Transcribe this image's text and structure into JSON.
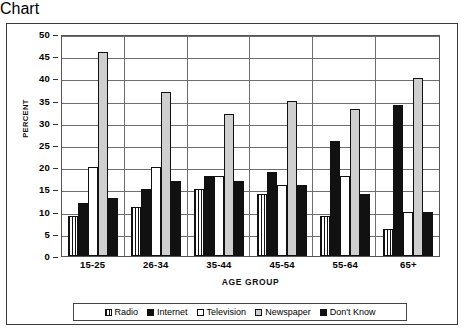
{
  "chart_data": {
    "type": "bar",
    "title": "",
    "xlabel": "AGE GROUP",
    "ylabel": "PERCENT",
    "categories": [
      "15-25",
      "26-34",
      "35-44",
      "45-54",
      "55-64",
      "65+"
    ],
    "ylim": [
      0,
      50
    ],
    "yticks": [
      0,
      5,
      10,
      15,
      20,
      25,
      30,
      35,
      40,
      45,
      50
    ],
    "grid": true,
    "legend_position": "bottom",
    "series": [
      {
        "name": "Radio",
        "fill": "vertical-stripes",
        "color": "#ffffff",
        "values": [
          9,
          11,
          15,
          14,
          9,
          6
        ]
      },
      {
        "name": "Internet",
        "fill": "solid",
        "color": "#111111",
        "values": [
          12,
          15,
          18,
          19,
          26,
          34
        ]
      },
      {
        "name": "Television",
        "fill": "white",
        "color": "#ffffff",
        "values": [
          20,
          20,
          18,
          16,
          18,
          10
        ]
      },
      {
        "name": "Newspaper",
        "fill": "light-gray",
        "color": "#cfcfcf",
        "values": [
          46,
          37,
          32,
          35,
          33,
          40
        ]
      },
      {
        "name": "Don't Know",
        "fill": "solid",
        "color": "#111111",
        "values": [
          13,
          17,
          17,
          16,
          14,
          10
        ]
      }
    ]
  }
}
